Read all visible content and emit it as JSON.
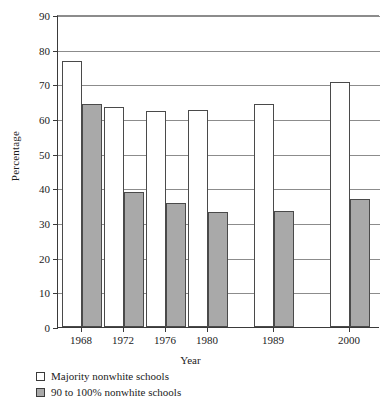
{
  "chart_data": {
    "type": "bar",
    "title": "",
    "xlabel": "Year",
    "ylabel": "Percentage",
    "categories": [
      "1968",
      "1972",
      "1976",
      "1980",
      "1989",
      "2000"
    ],
    "series": [
      {
        "name": "Majority nonwhite schools",
        "color": "#ffffff",
        "values": [
          76.6,
          63.6,
          62.3,
          62.6,
          64.4,
          70.8
        ]
      },
      {
        "name": "90 to 100% nonwhite schools",
        "color": "#a9a9a9",
        "values": [
          64.3,
          38.9,
          35.9,
          33.2,
          33.4,
          36.8
        ]
      }
    ],
    "ylim": [
      0,
      90
    ],
    "yticks": [
      0,
      10,
      20,
      30,
      40,
      50,
      60,
      70,
      80,
      90
    ],
    "ytick_labels": [
      "0",
      "10",
      "20",
      "30",
      "40",
      "50",
      "60",
      "70",
      "80",
      "90"
    ],
    "grid": true,
    "grid_axis": "y",
    "legend_position": "below-left",
    "legend": [
      "Majority nonwhite schools",
      "90 to 100% nonwhite schools"
    ]
  },
  "axes": {
    "y_title": "Percentage",
    "x_title": "Year"
  },
  "colors": {
    "bar_white": "#ffffff",
    "bar_gray": "#a9a9a9",
    "axis": "#3a3a3a",
    "grid": "#8c8c8c",
    "text": "#1b1b1b"
  }
}
